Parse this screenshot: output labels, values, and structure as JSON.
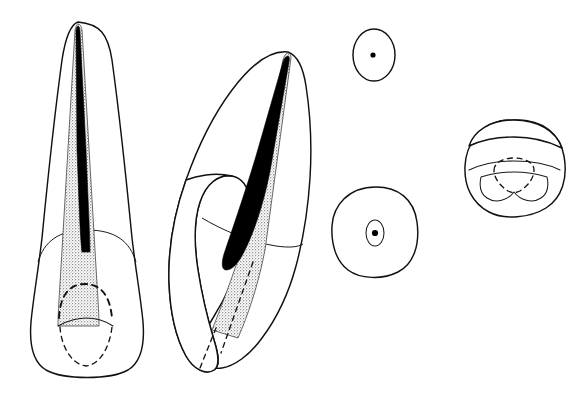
{
  "figure": {
    "title": "Maxillary central incisor — sectional anatomy plate",
    "background_color": "#ffffff",
    "width": 583,
    "height": 396,
    "text_labels_present": "none",
    "line_color": "#111111",
    "dentin_fill_color": "#d8d8d8",
    "pulp_color": "#000000"
  },
  "views": [
    {
      "id": "labial",
      "name": "labial-view",
      "description": "Full length tooth, facial aspect, crown at bottom, root tapering to apex at top",
      "features": {
        "crown_outline": "rounded rectangular crown with slightly convex mesial and distal surfaces",
        "root_outline": "long single root narrowing to a fine apex",
        "cervical_line": "gently curved cementoenamel junction arcing across the crown",
        "dentin": "stippled gray dentin body tapering from crown toward apex",
        "pulp_canal": "solid black narrow canal running the length of the root",
        "pulp_chamber": "dashed arc outlining the pulp chamber roof with pulp horns",
        "incisal_outline": "dashed oval indicating incisal edge contour through enamel"
      }
    },
    {
      "id": "proximal",
      "name": "proximal-view",
      "description": "Mesial or distal aspect, tooth tilted with cingulum bulge on lingual side",
      "features": {
        "crown_outline": "wedge shaped crown thick at cervix, tapering to incisal edge",
        "cingulum": "rounded lingual bulge at cervical third",
        "root_outline": "long root inclined to upper right ending in a fine apex",
        "cervical_line": "curved CEJ crossing obliquely",
        "dentin": "stippled gray dentin following the root taper",
        "pulp_canal": "solid black ribbon canal widening in the cervical region",
        "dashed_guides": "two dashed lines indicating internal crown contours"
      }
    },
    {
      "id": "root-cross-section",
      "name": "root-cross-section-view",
      "description": "Transverse section through the mid root",
      "features": {
        "outline": "small vertically elongated oval",
        "canal": "single small black round canal at the center"
      }
    },
    {
      "id": "cervical-cross-section",
      "name": "cervical-cross-section-view",
      "description": "Transverse section at the cervical level",
      "features": {
        "outline": "larger rounded triangular outline, broader toward the labial side",
        "pulp_outline": "small oval pulp outline",
        "canal": "single black round canal at the center of the pulp outline"
      }
    },
    {
      "id": "incisal",
      "name": "incisal-view-view",
      "description": "View from the incisal edge looking down on the crown",
      "features": {
        "outline": "broad rounded crown outline, labial surface toward the top",
        "incisal_edge": "curved line separating the labial surface band",
        "marginal_ridges": "pair of thin curved lines forming the lingual fossa border",
        "cingulum_outline": "rounded lingual lobe outline at the bottom",
        "pulp_chamber": "dashed outline of the pulp chamber with a rounded roof and pointed lingual extension"
      }
    }
  ]
}
